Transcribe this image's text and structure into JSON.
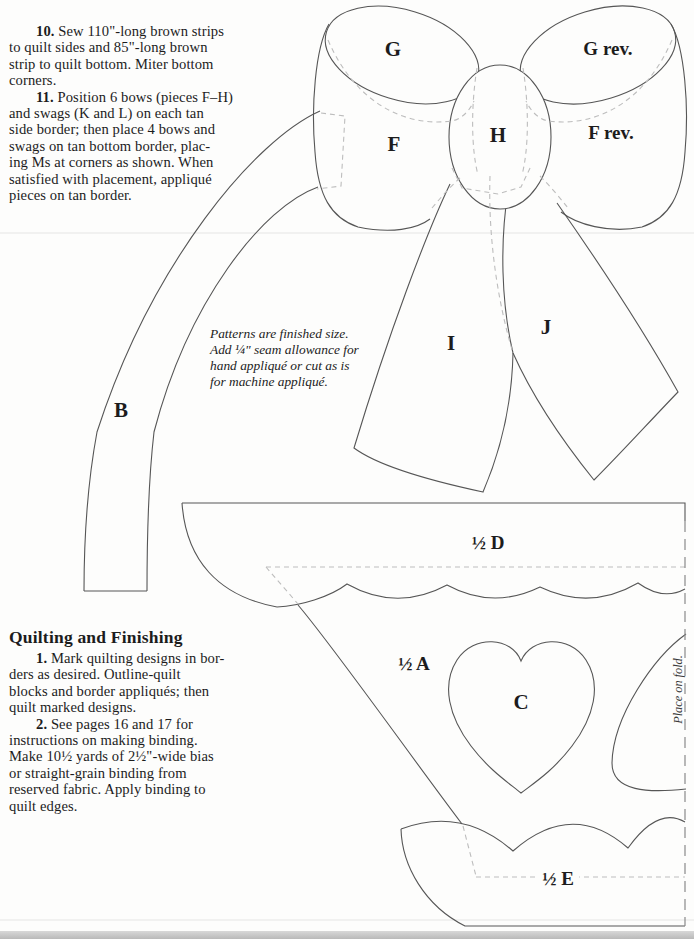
{
  "document": {
    "steps_top": [
      {
        "num": "10.",
        "rest": " Sew 110\"-long brown strips",
        "lines": [
          "to quilt sides and 85\"-long brown",
          "strip to quilt bottom. Miter bottom",
          "corners."
        ]
      },
      {
        "num": "11.",
        "rest": " Position 6 bows (pieces F–H)",
        "lines": [
          "and swags (K and L) on each tan",
          "side border; then place 4 bows and",
          "swags on tan bottom border, plac-",
          "ing Ms at corners as shown. When",
          "satisfied with placement, appliqué",
          "pieces on tan border."
        ]
      }
    ],
    "note_lines": [
      "Patterns are finished size.",
      "Add ¼\" seam allowance for",
      "hand appliqué or cut as is",
      "for machine appliqué."
    ],
    "finishing": {
      "heading": "Quilting and Finishing",
      "steps": [
        {
          "num": "1.",
          "rest": "  Mark quilting designs in bor-",
          "lines": [
            "ders as desired. Outline-quilt",
            "blocks and border appliqués; then",
            "quilt marked designs."
          ]
        },
        {
          "num": "2.",
          "rest": " See pages 16 and 17 for",
          "lines": [
            "instructions on making binding.",
            "Make 10½ yards of 2½\"-wide bias",
            "or straight-grain binding from",
            "reserved fabric. Apply binding to",
            "quilt edges."
          ]
        }
      ]
    },
    "pattern_labels": {
      "g": "G",
      "g_rev": "G rev.",
      "f": "F",
      "f_rev": "F rev.",
      "h": "H",
      "i": "I",
      "j": "J",
      "b": "B",
      "half_d": "½ D",
      "half_a": "½ A",
      "c": "C",
      "half_e": "½ E",
      "fold_note": "Place on fold."
    },
    "colors": {
      "line": "#565656",
      "dashed": "#bdbdbd",
      "text": "#1c1c1c",
      "paper": "#fdfdfc"
    }
  }
}
